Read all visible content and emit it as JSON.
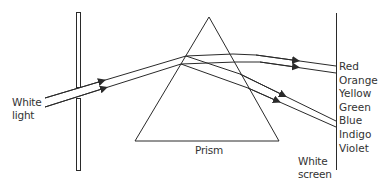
{
  "diagram": {
    "labels": {
      "source_line1": "White",
      "source_line2": "light",
      "prism": "Prism",
      "screen_line1": "White",
      "screen_line2": "screen"
    },
    "spectrum": [
      "Red",
      "Orange",
      "Yellow",
      "Green",
      "Blue",
      "Indigo",
      "Violet"
    ],
    "colors": {
      "line": "#2a2a2a",
      "text": "#333333",
      "background": "#ffffff"
    }
  }
}
